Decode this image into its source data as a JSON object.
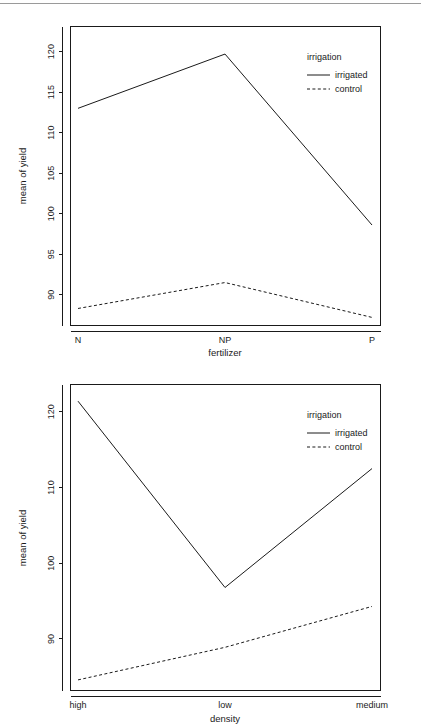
{
  "page": {
    "divider": "top-rule"
  },
  "chart_data": [
    {
      "id": "fertilizer-plot",
      "type": "line",
      "title": "",
      "xlabel": "fertilizer",
      "ylabel": "mean of yield",
      "categories": [
        "N",
        "NP",
        "P"
      ],
      "yticks": [
        90,
        95,
        100,
        105,
        110,
        115,
        120
      ],
      "ytick_labels": [
        "90",
        "95",
        "100",
        "105",
        "110",
        "115",
        "120"
      ],
      "ylim": [
        86.2,
        123.1
      ],
      "grid": false,
      "legend": {
        "title": "irrigation",
        "position": "top-right-inside",
        "entries": [
          {
            "label": "irrigated",
            "style": "solid"
          },
          {
            "label": "control",
            "style": "dashed"
          }
        ]
      },
      "series": [
        {
          "name": "irrigated",
          "style": "solid",
          "values": [
            113.0,
            119.7,
            98.6
          ]
        },
        {
          "name": "control",
          "style": "dashed",
          "values": [
            88.3,
            91.5,
            87.2
          ]
        }
      ]
    },
    {
      "id": "density-plot",
      "type": "line",
      "title": "",
      "xlabel": "density",
      "ylabel": "mean of yield",
      "categories": [
        "high",
        "low",
        "medium"
      ],
      "yticks": [
        90,
        100,
        110,
        120
      ],
      "ytick_labels": [
        "90",
        "100",
        "110",
        "120"
      ],
      "ylim": [
        83.2,
        123.6
      ],
      "grid": false,
      "legend": {
        "title": "irrigation",
        "position": "top-right-inside",
        "entries": [
          {
            "label": "irrigated",
            "style": "solid"
          },
          {
            "label": "control",
            "style": "dashed"
          }
        ]
      },
      "series": [
        {
          "name": "irrigated",
          "style": "solid",
          "values": [
            121.4,
            96.8,
            112.5
          ]
        },
        {
          "name": "control",
          "style": "dashed",
          "values": [
            84.6,
            88.9,
            94.3
          ]
        }
      ]
    }
  ]
}
